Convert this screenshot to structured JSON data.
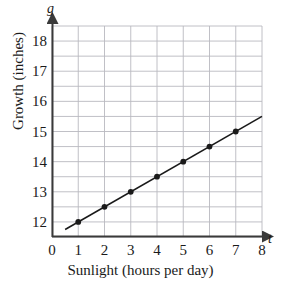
{
  "chart_data": {
    "type": "line",
    "title": "",
    "xlabel": "Sunlight (hours per day)",
    "ylabel": "Growth (inches)",
    "x_variable": "t",
    "y_variable": "g",
    "xlim": [
      0,
      8
    ],
    "ylim": [
      11.5,
      18.5
    ],
    "xticks": [
      "0",
      "1",
      "2",
      "3",
      "4",
      "5",
      "6",
      "7",
      "8"
    ],
    "xtick_values": [
      0,
      1,
      2,
      3,
      4,
      5,
      6,
      7,
      8
    ],
    "yticks": [
      "12",
      "13",
      "14",
      "15",
      "16",
      "17",
      "18"
    ],
    "ytick_values": [
      12,
      13,
      14,
      15,
      16,
      17,
      18
    ],
    "grid": true,
    "grid_x_step": 1,
    "grid_y_step": 0.5,
    "legend": "none",
    "x": [
      1,
      2,
      3,
      4,
      5,
      6,
      7
    ],
    "values": [
      12,
      12.5,
      13,
      13.5,
      14,
      14.5,
      15
    ],
    "series": [
      {
        "name": "Growth vs Sunlight",
        "x": [
          1,
          2,
          3,
          4,
          5,
          6,
          7
        ],
        "values": [
          12,
          12.5,
          13,
          13.5,
          14,
          14.5,
          15
        ],
        "marker": "filled-circle",
        "line_color": "#1a1a1a"
      }
    ],
    "trend_line": {
      "slope": 0.5,
      "intercept": 11.5,
      "x_start": 0.5,
      "x_end": 8.0,
      "y_start": 11.75,
      "y_end": 15.5
    }
  },
  "axis_names": {
    "x_var": "t",
    "y_var": "g"
  },
  "labels": {
    "x_title": "Sunlight (hours per day)",
    "y_title": "Growth (inches)"
  }
}
